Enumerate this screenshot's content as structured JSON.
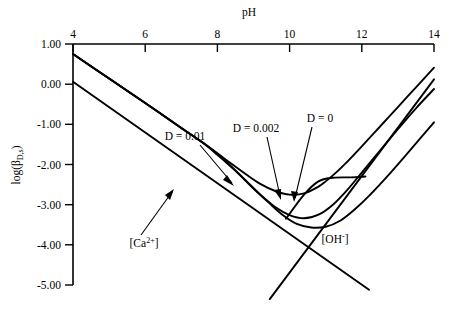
{
  "chart_data": {
    "type": "line",
    "title": "",
    "xlabel": "pH",
    "ylabel": "log(βD,s)",
    "ylabel_parts": {
      "base": "log(β",
      "sub": "D,s",
      "tail": ")"
    },
    "xlim": [
      4,
      14
    ],
    "ylim": [
      -5.0,
      1.0
    ],
    "x_axis_position": "top",
    "grid": false,
    "legend": "none",
    "xticks": [
      4,
      6,
      8,
      10,
      12,
      14
    ],
    "xtick_labels": [
      "4",
      "6",
      "8",
      "10",
      "12",
      "14"
    ],
    "yticks": [
      1.0,
      0.0,
      -1.0,
      -2.0,
      -3.0,
      -4.0,
      -5.0
    ],
    "ytick_labels": [
      "1.00",
      "0.00",
      "-1.00",
      "-2.00",
      "-3.00",
      "-4.00",
      "-5.00"
    ],
    "series": [
      {
        "name": "D = 0.01",
        "label": "D = 0.01",
        "x": [
          4.0,
          5.0,
          6.0,
          7.0,
          7.6,
          8.0,
          8.4,
          8.8,
          9.2,
          9.6,
          10.0,
          10.4,
          10.8,
          11.0,
          11.3,
          11.6,
          12.0,
          12.5,
          13.0,
          13.5,
          14.0
        ],
        "y": [
          0.75,
          0.14,
          -0.47,
          -1.09,
          -1.46,
          -1.72,
          -1.99,
          -2.25,
          -2.49,
          -2.66,
          -2.75,
          -2.72,
          -2.55,
          -2.42,
          -2.19,
          -1.93,
          -1.55,
          -1.06,
          -0.57,
          -0.08,
          0.41
        ]
      },
      {
        "name": "D = 0.002",
        "label": "D = 0.002",
        "x": [
          4.0,
          5.0,
          6.0,
          7.0,
          7.6,
          8.0,
          8.4,
          8.8,
          9.2,
          9.6,
          10.0,
          10.4,
          10.8,
          11.2,
          11.6,
          12.0,
          12.5,
          13.0,
          13.5,
          14.0
        ],
        "y": [
          0.75,
          0.14,
          -0.47,
          -1.09,
          -1.46,
          -1.74,
          -2.06,
          -2.41,
          -2.76,
          -3.06,
          -3.26,
          -3.34,
          -3.25,
          -3.0,
          -2.63,
          -2.2,
          -1.66,
          -1.12,
          -0.6,
          -0.12
        ]
      },
      {
        "name": "D = 0",
        "label": "D = 0",
        "x": [
          4.0,
          5.0,
          6.0,
          7.0,
          7.6,
          8.0,
          8.5,
          9.0,
          9.4,
          9.8,
          10.2,
          10.6,
          11.0,
          11.4,
          11.8,
          12.2,
          12.8,
          13.4,
          14.0
        ],
        "y": [
          0.75,
          0.14,
          -0.47,
          -1.09,
          -1.46,
          -1.76,
          -2.16,
          -2.6,
          -2.93,
          -3.25,
          -3.48,
          -3.57,
          -3.55,
          -3.4,
          -3.12,
          -2.78,
          -2.2,
          -1.58,
          -0.95
        ]
      },
      {
        "name": "[Ca2+]",
        "label": "[Ca2+]",
        "type": "asymptote",
        "x": [
          4.0,
          14.0
        ],
        "y": [
          0.06,
          null
        ],
        "note": "straight descending line from (4, 0.06) to (12.15, -5.1)"
      },
      {
        "name": "[OH-]",
        "label": "[OH-]",
        "type": "asymptote",
        "note": "straight ascending line from (9.5, -5.35) to (14, 0.12)"
      }
    ],
    "annotations": [
      {
        "text": "D = 0.01",
        "points_to_curve": "D = 0.01"
      },
      {
        "text": "D = 0.002",
        "points_to_curve": "D = 0.002"
      },
      {
        "text": "D = 0",
        "points_to_curve": "D = 0"
      },
      {
        "text": "[Ca2+]",
        "points_to_curve": "[Ca2+]"
      },
      {
        "text": "[OH-]",
        "points_to_curve": "[OH-]"
      }
    ],
    "species_labels": {
      "calcium": {
        "bracket_open": "[",
        "symbol": "Ca",
        "charge": "2+",
        "bracket_close": "]"
      },
      "hydroxide": {
        "bracket_open": "[",
        "symbol": "OH",
        "charge": "-",
        "bracket_close": "]"
      }
    },
    "ann_labels": {
      "d001": "D = 0.01",
      "d0002": "D = 0.002",
      "d0": "D = 0"
    }
  }
}
